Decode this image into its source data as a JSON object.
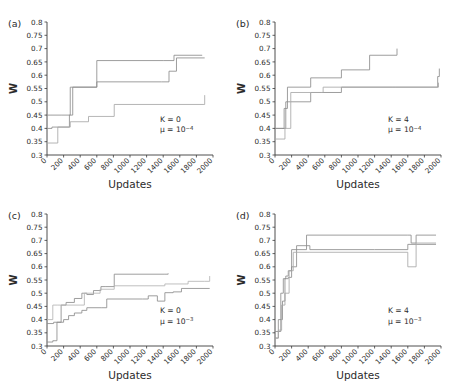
{
  "figure": {
    "background": "#ffffff",
    "axis_color": "#3a3a3a",
    "text_color": "#2b2b2b"
  },
  "axes": {
    "xlabel": "Updates",
    "ylabel": "W",
    "xlim": [
      0,
      2000
    ],
    "ylim": [
      0.3,
      0.8
    ],
    "xticks": [
      0,
      200,
      400,
      600,
      800,
      1000,
      1200,
      1400,
      1600,
      1800,
      2000
    ],
    "xtick_labels": [
      "0",
      "200",
      "400",
      "600",
      "800",
      "1000",
      "1200",
      "1400",
      "1600",
      "1800",
      "2000"
    ],
    "yticks": [
      0.3,
      0.35,
      0.4,
      0.45,
      0.5,
      0.55,
      0.6,
      0.65,
      0.7,
      0.75,
      0.8
    ],
    "ytick_labels": [
      "0.3",
      "0.35",
      "0.4",
      "0.45",
      "0.5",
      "0.55",
      "0.6",
      "0.65",
      "0.7",
      "0.75",
      "0.8"
    ],
    "grid": false,
    "legend": "none",
    "xtick_label_rotation": -45
  },
  "chart_data": [
    {
      "type": "line",
      "panel": "a",
      "panel_label": "(a)",
      "title": "",
      "xlabel": "Updates",
      "ylabel": "W",
      "xlim": [
        0,
        2000
      ],
      "ylim": [
        0.3,
        0.8
      ],
      "drawstyle": "steps-post",
      "annotations": [
        {
          "text": "K = 0",
          "x": 1360,
          "y": 0.425
        },
        {
          "text": "μ = 10−4",
          "x": 1360,
          "y": 0.385
        }
      ],
      "params": {
        "K": 0,
        "mu": "10^-4"
      },
      "series": [
        {
          "name": "run-1",
          "color": "#8c8c8c",
          "x": [
            0,
            60,
            170,
            280,
            600,
            1400,
            1530,
            1870
          ],
          "y": [
            0.45,
            0.45,
            0.45,
            0.555,
            0.655,
            0.655,
            0.675,
            0.675
          ]
        },
        {
          "name": "run-2",
          "color": "#8c8c8c",
          "x": [
            0,
            60,
            180,
            270,
            310,
            600,
            1380,
            1470,
            1560,
            1900
          ],
          "y": [
            0.4,
            0.405,
            0.405,
            0.45,
            0.555,
            0.575,
            0.575,
            0.615,
            0.665,
            0.665
          ]
        },
        {
          "name": "run-3",
          "color": "#a8a8a8",
          "x": [
            0,
            60,
            130,
            280,
            500,
            810,
            1880,
            1900
          ],
          "y": [
            0.345,
            0.345,
            0.405,
            0.425,
            0.445,
            0.49,
            0.49,
            0.525
          ]
        }
      ]
    },
    {
      "type": "line",
      "panel": "b",
      "panel_label": "(b)",
      "title": "",
      "xlabel": "Updates",
      "ylabel": "W",
      "xlim": [
        0,
        2000
      ],
      "ylim": [
        0.3,
        0.8
      ],
      "drawstyle": "steps-post",
      "annotations": [
        {
          "text": "K = 4",
          "x": 1360,
          "y": 0.425
        },
        {
          "text": "μ = 10−4",
          "x": 1360,
          "y": 0.385
        }
      ],
      "params": {
        "K": 4,
        "mu": "10^-4"
      },
      "series": [
        {
          "name": "run-1",
          "color": "#8c8c8c",
          "x": [
            0,
            70,
            110,
            150,
            430,
            800,
            1140,
            1460,
            1470
          ],
          "y": [
            0.4,
            0.4,
            0.475,
            0.555,
            0.59,
            0.62,
            0.675,
            0.675,
            0.7
          ]
        },
        {
          "name": "run-2",
          "color": "#8c8c8c",
          "x": [
            0,
            80,
            130,
            190,
            430,
            560,
            800,
            1420,
            1960,
            1980
          ],
          "y": [
            0.4,
            0.4,
            0.5,
            0.5,
            0.535,
            0.535,
            0.555,
            0.555,
            0.595,
            0.625
          ]
        },
        {
          "name": "run-3",
          "color": "#a8a8a8",
          "x": [
            0,
            60,
            120,
            190,
            430,
            580,
            1450,
            1970
          ],
          "y": [
            0.36,
            0.36,
            0.4,
            0.535,
            0.535,
            0.555,
            0.555,
            0.572
          ]
        }
      ]
    },
    {
      "type": "line",
      "panel": "c",
      "panel_label": "(c)",
      "title": "",
      "xlabel": "Updates",
      "ylabel": "W",
      "xlim": [
        0,
        2000
      ],
      "ylim": [
        0.3,
        0.8
      ],
      "drawstyle": "steps-post",
      "annotations": [
        {
          "text": "K = 0",
          "x": 1360,
          "y": 0.425
        },
        {
          "text": "μ = 10−3",
          "x": 1360,
          "y": 0.385
        }
      ],
      "params": {
        "K": 0,
        "mu": "10^-3"
      },
      "series": [
        {
          "name": "run-1",
          "color": "#8c8c8c",
          "x": [
            0,
            80,
            170,
            230,
            330,
            420,
            480,
            560,
            650,
            700,
            810,
            1420,
            1460
          ],
          "y": [
            0.385,
            0.39,
            0.455,
            0.465,
            0.48,
            0.5,
            0.495,
            0.51,
            0.525,
            0.525,
            0.572,
            0.572,
            0.575
          ]
        },
        {
          "name": "run-2",
          "color": "#b4b4b4",
          "x": [
            0,
            70,
            130,
            400,
            450,
            560,
            640,
            810,
            1180,
            1420,
            1700,
            1900,
            1960
          ],
          "y": [
            0.4,
            0.455,
            0.455,
            0.455,
            0.5,
            0.5,
            0.515,
            0.528,
            0.528,
            0.535,
            0.545,
            0.545,
            0.565
          ]
        },
        {
          "name": "run-3",
          "color": "#8c8c8c",
          "x": [
            0,
            70,
            120,
            200,
            260,
            330,
            420,
            480,
            660,
            720,
            1150,
            1220,
            1330,
            1420,
            1520,
            1620,
            1960
          ],
          "y": [
            0.315,
            0.32,
            0.39,
            0.4,
            0.415,
            0.425,
            0.435,
            0.445,
            0.445,
            0.478,
            0.478,
            0.49,
            0.47,
            0.502,
            0.505,
            0.518,
            0.518
          ]
        }
      ]
    },
    {
      "type": "line",
      "panel": "d",
      "panel_label": "(d)",
      "title": "",
      "xlabel": "Updates",
      "ylabel": "W",
      "xlim": [
        0,
        2000
      ],
      "ylim": [
        0.3,
        0.8
      ],
      "drawstyle": "steps-post",
      "annotations": [
        {
          "text": "K = 4",
          "x": 1360,
          "y": 0.425
        },
        {
          "text": "μ = 10−3",
          "x": 1360,
          "y": 0.385
        }
      ],
      "params": {
        "K": 4,
        "mu": "10^-3"
      },
      "series": [
        {
          "name": "run-1",
          "color": "#8c8c8c",
          "x": [
            0,
            40,
            70,
            100,
            130,
            160,
            200,
            380,
            1600,
            1640,
            1700,
            1940
          ],
          "y": [
            0.355,
            0.355,
            0.5,
            0.555,
            0.565,
            0.585,
            0.665,
            0.72,
            0.72,
            0.69,
            0.72,
            0.72
          ]
        },
        {
          "name": "run-2",
          "color": "#8c8c8c",
          "x": [
            0,
            40,
            90,
            120,
            160,
            200,
            260,
            420,
            1200,
            1600,
            1700,
            1940
          ],
          "y": [
            0.33,
            0.4,
            0.47,
            0.555,
            0.56,
            0.6,
            0.68,
            0.665,
            0.665,
            0.685,
            0.685,
            0.685
          ]
        },
        {
          "name": "run-3",
          "color": "#a8a8a8",
          "x": [
            0,
            40,
            80,
            120,
            170,
            220,
            420,
            1600,
            1700,
            1940
          ],
          "y": [
            0.33,
            0.36,
            0.455,
            0.5,
            0.585,
            0.655,
            0.655,
            0.6,
            0.69,
            0.69
          ]
        }
      ]
    }
  ]
}
